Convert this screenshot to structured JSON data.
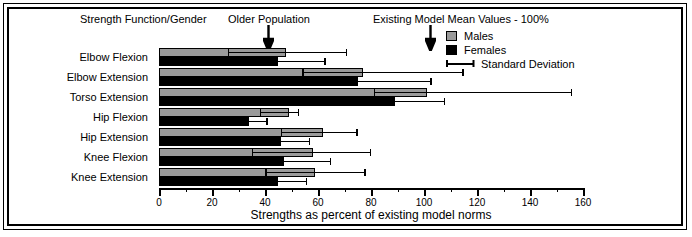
{
  "annotations": {
    "strength_function_gender": "Strength Function/Gender",
    "older_population": "Older Population",
    "existing_model": "Existing Model Mean Values - 100%"
  },
  "legend": {
    "items": [
      {
        "label": "Males",
        "swatch": "males-swatch",
        "color": "#9a9a9a"
      },
      {
        "label": "Females",
        "swatch": "females-swatch",
        "color": "#000000"
      },
      {
        "label": "Standard Deviation",
        "swatch": "sd-swatch",
        "color": "#000000"
      }
    ]
  },
  "axis": {
    "xlabel": "Strengths as percent of existing model norms",
    "ticks": [
      "0",
      "20",
      "40",
      "60",
      "80",
      "100",
      "120",
      "140",
      "160"
    ],
    "tick_values": [
      0,
      20,
      40,
      60,
      80,
      100,
      120,
      140,
      160
    ],
    "minor_tick_values": [
      10,
      30,
      50,
      70,
      90,
      110,
      130,
      150
    ],
    "xlim": [
      0,
      160
    ]
  },
  "chart_data": {
    "type": "bar",
    "orientation": "horizontal",
    "title": "",
    "subtitle": "",
    "xlabel": "Strengths as percent of existing model norms",
    "ylabel": "Strength Function/Gender",
    "xlim": [
      0,
      160
    ],
    "grid": false,
    "legend_position": "top-right",
    "categories": [
      "Elbow Flexion",
      "Elbow Extension",
      "Torso Extension",
      "Hip Flexion",
      "Hip Extension",
      "Knee Flexion",
      "Knee Extension"
    ],
    "series": [
      {
        "name": "Males",
        "color": "#9a9a9a",
        "values": [
          48,
          77,
          101,
          49,
          62,
          58,
          59
        ],
        "sd_low": [
          26,
          54,
          81,
          38,
          46,
          35,
          40
        ],
        "sd_high": [
          71,
          115,
          156,
          53,
          75,
          80,
          78
        ]
      },
      {
        "name": "Females",
        "color": "#000000",
        "values": [
          45,
          75,
          89,
          34,
          46,
          47,
          45
        ],
        "sd_low": [
          26,
          55,
          70,
          27,
          35,
          29,
          33
        ],
        "sd_high": [
          63,
          103,
          108,
          41,
          57,
          65,
          56
        ]
      }
    ],
    "annotations": [
      {
        "label": "Older Population",
        "x": 41,
        "type": "arrow-down"
      },
      {
        "label": "Existing Model Mean Values - 100%",
        "x": 102,
        "type": "arrow-down"
      }
    ]
  }
}
